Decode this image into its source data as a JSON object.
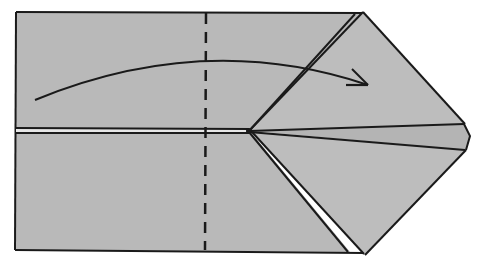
{
  "diagram": {
    "type": "origami-fold-step",
    "caption": "Valley fold the left part along the dashed line to the right",
    "colors": {
      "background": "#ffffff",
      "paper": "#b9b9b9",
      "paper_layer": "#bdbdbd",
      "stroke": "#1a1a1a",
      "highlight": "#e6e6e6"
    },
    "elements": {
      "paper_sheet": "rectangle body of folded paper",
      "center_slit": "horizontal double line (paper edges meeting at center)",
      "fold_line": "vertical dashed valley-fold line",
      "fold_arrow": "curved arrow indicating fold direction left to right",
      "pointed_flap": "layered triangular point on the right side"
    }
  }
}
